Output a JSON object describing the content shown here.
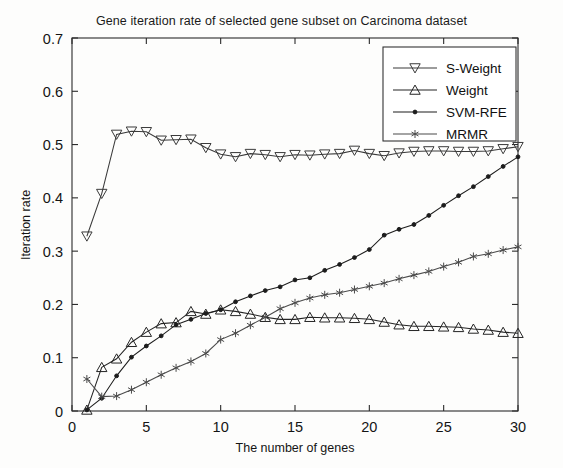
{
  "chart_data": {
    "type": "line",
    "title": "Gene iteration rate of selected gene subset on Carcinoma dataset",
    "xlabel": "The number of genes",
    "ylabel": "Iteration rate",
    "xlim": [
      0,
      30
    ],
    "ylim": [
      0,
      0.7
    ],
    "xticks": [
      0,
      5,
      10,
      15,
      20,
      25,
      30
    ],
    "yticks": [
      0,
      0.1,
      0.2,
      0.3,
      0.4,
      0.5,
      0.6,
      0.7
    ],
    "xtick_labels": [
      "0",
      "5",
      "10",
      "15",
      "20",
      "25",
      "30"
    ],
    "ytick_labels": [
      "0",
      "0.1",
      "0.2",
      "0.3",
      "0.4",
      "0.5",
      "0.6",
      "0.7"
    ],
    "grid": false,
    "legend_position": "upper right",
    "x": [
      1,
      2,
      3,
      4,
      5,
      6,
      7,
      8,
      9,
      10,
      11,
      12,
      13,
      14,
      15,
      16,
      17,
      18,
      19,
      20,
      21,
      22,
      23,
      24,
      25,
      26,
      27,
      28,
      29,
      30
    ],
    "series": [
      {
        "name": "S-Weight",
        "marker": "triangle-down",
        "color": "#3a3a3a",
        "values": [
          0.328,
          0.408,
          0.519,
          0.525,
          0.524,
          0.508,
          0.509,
          0.51,
          0.494,
          0.482,
          0.477,
          0.483,
          0.481,
          0.477,
          0.481,
          0.48,
          0.482,
          0.483,
          0.489,
          0.483,
          0.479,
          0.484,
          0.487,
          0.488,
          0.488,
          0.487,
          0.487,
          0.488,
          0.492,
          0.496
        ]
      },
      {
        "name": "Weight",
        "marker": "triangle-up",
        "color": "#242424",
        "values": [
          0.002,
          0.082,
          0.098,
          0.129,
          0.148,
          0.164,
          0.166,
          0.187,
          0.182,
          0.19,
          0.187,
          0.182,
          0.176,
          0.172,
          0.172,
          0.176,
          0.175,
          0.175,
          0.174,
          0.172,
          0.167,
          0.162,
          0.159,
          0.159,
          0.158,
          0.157,
          0.154,
          0.152,
          0.148,
          0.146
        ]
      },
      {
        "name": "SVM-RFE",
        "marker": "dot",
        "color": "#1c1c1c",
        "values": [
          0.002,
          0.024,
          0.066,
          0.101,
          0.122,
          0.141,
          0.162,
          0.172,
          0.183,
          0.19,
          0.205,
          0.216,
          0.226,
          0.233,
          0.246,
          0.25,
          0.264,
          0.275,
          0.288,
          0.303,
          0.33,
          0.341,
          0.35,
          0.367,
          0.386,
          0.404,
          0.421,
          0.44,
          0.459,
          0.477
        ]
      },
      {
        "name": "MRMR",
        "marker": "asterisk",
        "color": "#4a4a4a",
        "values": [
          0.06,
          0.027,
          0.028,
          0.04,
          0.054,
          0.068,
          0.081,
          0.093,
          0.108,
          0.134,
          0.146,
          0.161,
          0.176,
          0.192,
          0.203,
          0.212,
          0.218,
          0.222,
          0.228,
          0.234,
          0.24,
          0.248,
          0.255,
          0.262,
          0.271,
          0.279,
          0.29,
          0.295,
          0.302,
          0.308
        ]
      }
    ]
  },
  "legend": {
    "items": [
      {
        "label": "S-Weight"
      },
      {
        "label": "Weight"
      },
      {
        "label": "SVM-RFE"
      },
      {
        "label": "MRMR"
      }
    ]
  }
}
